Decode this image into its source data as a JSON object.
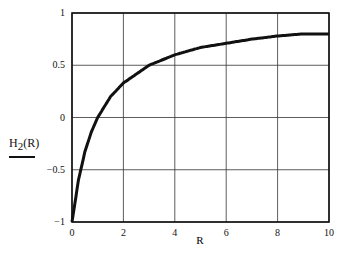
{
  "chart_data": {
    "type": "line",
    "title": "",
    "xlabel": "R",
    "ylabel": "H2(R)",
    "ylabel_main": "H",
    "ylabel_sub": "2",
    "ylabel_arg": "(R)",
    "xlim": [
      0,
      10
    ],
    "ylim": [
      -1,
      1
    ],
    "x_ticks": [
      "0",
      "2",
      "4",
      "6",
      "8",
      "10"
    ],
    "y_ticks": [
      "1",
      "0.5",
      "0",
      "-0.5",
      "-1"
    ],
    "grid": true,
    "legend": null,
    "series": [
      {
        "name": "H2(R)",
        "x": [
          0,
          0.25,
          0.5,
          0.75,
          1,
          1.5,
          2,
          3,
          4,
          5,
          6,
          7,
          8,
          9,
          10
        ],
        "values": [
          -1,
          -0.6,
          -0.33,
          -0.14,
          0,
          0.2,
          0.33,
          0.5,
          0.6,
          0.67,
          0.71,
          0.75,
          0.78,
          0.8,
          0.8
        ]
      }
    ]
  }
}
